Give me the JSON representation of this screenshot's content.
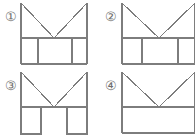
{
  "sheet": {
    "width": 195,
    "height": 140,
    "background_color": "#ffffff",
    "line_color": "#7d7d7d",
    "label_color": "#6e6e6e",
    "layout": "2x2 grid of four line-drawing figures"
  },
  "figures": [
    {
      "id": "figure-1",
      "label": "①",
      "label_number": "1",
      "description": "Rectangle outline with a V-shaped notch cut into the top edge; lower band divided into three cells (narrow, wide, narrow).",
      "top_shape": "v-notch",
      "bottom_band": "three-cells",
      "cropped": false
    },
    {
      "id": "figure-2",
      "label": "②",
      "label_number": "2",
      "description": "Rectangle outline with a V-shaped notch cut into the top edge; lower band divided into cells; figure runs past the right edge of the image.",
      "top_shape": "v-notch",
      "bottom_band": "three-cells",
      "cropped": true
    },
    {
      "id": "figure-3",
      "label": "③",
      "label_number": "3",
      "description": "Rectangle outline with a V-shaped notch cut into the top edge; lower band forms two separate square legs with an open gap between them.",
      "top_shape": "v-notch",
      "bottom_band": "two-legs",
      "cropped": false
    },
    {
      "id": "figure-4",
      "label": "④",
      "label_number": "4",
      "description": "Rectangle outline with a V-shaped notch cut into the top edge; lower band is a plain undivided rectangle; figure runs past the right edge of the image.",
      "top_shape": "v-notch",
      "bottom_band": "plain",
      "cropped": true
    }
  ]
}
